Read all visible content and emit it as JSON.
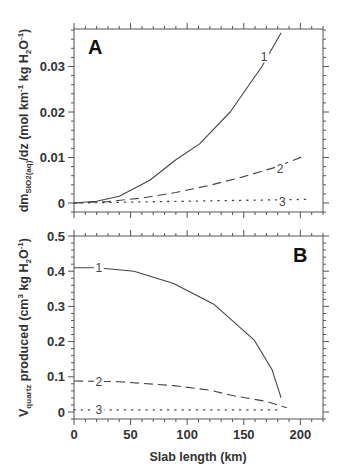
{
  "chart_data": [
    {
      "type": "line",
      "panel": "A",
      "title": "",
      "xlabel": "",
      "ylabel": "dm_SiO2(aq)/dz (mol km^-1 kg H2O^-1)",
      "ylabel_parts": {
        "main": "dm",
        "sub": "SiO2(aq)",
        "rest": "/dz  (mol  km",
        "sup1": "-1",
        "mid": "  kg  H",
        "sub2": "2",
        "o": "O",
        "sup2": "-1",
        "end": ")"
      },
      "xlim": [
        0,
        220
      ],
      "ylim": [
        -0.0025,
        0.038
      ],
      "yticks": [
        0,
        0.01,
        0.02,
        0.03
      ],
      "ytick_labels": [
        "0",
        "0.01",
        "0.02",
        "0.03"
      ],
      "xticks": [
        0,
        50,
        100,
        150,
        200
      ],
      "grid": false,
      "legend": "inline numeric labels",
      "series": [
        {
          "name": "1",
          "style": "solid",
          "x": [
            0,
            20,
            40,
            67,
            90,
            111,
            138,
            166,
            183
          ],
          "y": [
            0,
            0.0004,
            0.0015,
            0.005,
            0.0095,
            0.013,
            0.02,
            0.03,
            0.0374
          ],
          "label_pos": [
            168,
            0.0322
          ]
        },
        {
          "name": "2",
          "style": "dashed",
          "x": [
            0,
            30,
            60,
            90,
            120,
            150,
            180,
            205
          ],
          "y": [
            0,
            0.0003,
            0.0011,
            0.0023,
            0.0039,
            0.0058,
            0.008,
            0.0105
          ],
          "label_pos": [
            182,
            0.0075
          ]
        },
        {
          "name": "3",
          "style": "dotted",
          "x": [
            0,
            50,
            100,
            150,
            206
          ],
          "y": [
            0,
            0.0002,
            0.0004,
            0.0006,
            0.0008
          ],
          "label_pos": [
            184,
            0.0003
          ]
        }
      ]
    },
    {
      "type": "line",
      "panel": "B",
      "title": "",
      "xlabel": "Slab  length  (km)",
      "ylabel": "V_quartz produced (cm^3 kg H2O^-1)",
      "ylabel_parts": {
        "main": "V",
        "sub": "quartz",
        "rest": "  produced  (cm",
        "sup1": "3",
        "mid": "  kg  H",
        "sub2": "2",
        "o": "O",
        "sup2": "-1",
        "end": ")"
      },
      "xlim": [
        0,
        220
      ],
      "ylim": [
        -0.02,
        0.5
      ],
      "yticks": [
        0,
        0.1,
        0.2,
        0.3,
        0.4,
        0.5
      ],
      "ytick_labels": [
        "0",
        "0.1",
        "0.2",
        "0.3",
        "0.4",
        "0.5"
      ],
      "xticks": [
        0,
        50,
        100,
        150,
        200
      ],
      "xtick_labels": [
        "0",
        "50",
        "100",
        "150",
        "200"
      ],
      "grid": false,
      "legend": "inline numeric labels",
      "series": [
        {
          "name": "1",
          "style": "solid",
          "x": [
            0,
            20,
            53,
            88,
            124,
            159,
            175,
            183
          ],
          "y": [
            0.41,
            0.41,
            0.4,
            0.365,
            0.305,
            0.205,
            0.12,
            0.04
          ],
          "label_pos": [
            22,
            0.41
          ]
        },
        {
          "name": "2",
          "style": "dashed",
          "x": [
            0,
            40,
            88,
            120,
            141,
            170,
            188
          ],
          "y": [
            0.088,
            0.086,
            0.075,
            0.062,
            0.046,
            0.03,
            0.012
          ],
          "label_pos": [
            22,
            0.088
          ]
        },
        {
          "name": "3",
          "style": "dotted",
          "x": [
            0,
            60,
            120,
            180
          ],
          "y": [
            0.006,
            0.006,
            0.006,
            0.006
          ],
          "label_pos": [
            22,
            0.006
          ]
        }
      ]
    }
  ]
}
